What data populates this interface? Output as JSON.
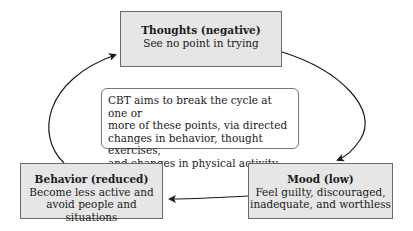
{
  "diagram": {
    "type": "cycle",
    "nodes": [
      {
        "id": "thoughts",
        "title": "Thoughts (negative)",
        "description": "See no point in trying"
      },
      {
        "id": "mood",
        "title": "Mood (low)",
        "description": "Feel guilty, discouraged, inadequate, and worthless"
      },
      {
        "id": "behavior",
        "title": "Behavior (reduced)",
        "description": "Become less active and avoid people and situations"
      }
    ],
    "edges": [
      {
        "from": "thoughts",
        "to": "mood"
      },
      {
        "from": "mood",
        "to": "behavior"
      },
      {
        "from": "behavior",
        "to": "thoughts"
      }
    ],
    "note": "CBT aims to break the cycle at one or more of these points, via directed changes in behavior, thought exercises, and changes in physical activity."
  },
  "thoughts": {
    "title": "Thoughts (negative)",
    "line1": "See no point in trying"
  },
  "mood": {
    "title": "Mood (low)",
    "line1": "Feel guilty, discouraged,",
    "line2": "inadequate, and worthless"
  },
  "behavior": {
    "title": "Behavior (reduced)",
    "line1": "Become less active and",
    "line2": "avoid people and situations"
  },
  "note": {
    "line1": "CBT aims to break the cycle at one or",
    "line2": "more of these points, via directed",
    "line3": "changes in behavior, thought exercises,",
    "line4": "and changes in physical activity."
  },
  "colors": {
    "box_fill": "#e6e6e6",
    "box_border": "#6a6a6a",
    "arrow": "#1a1a1a"
  }
}
